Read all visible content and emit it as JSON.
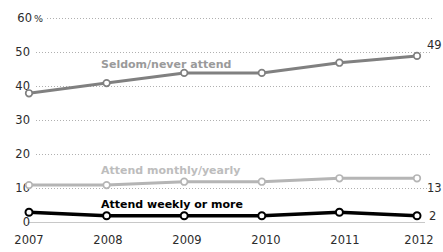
{
  "chart_data": {
    "type": "line",
    "title": "",
    "subtitle": "",
    "xlabel": "",
    "ylabel": "",
    "categories": [
      "2007",
      "2008",
      "2009",
      "2010",
      "2011",
      "2012"
    ],
    "x": [
      2007,
      2008,
      2009,
      2010,
      2011,
      2012
    ],
    "ylim": [
      0,
      60
    ],
    "yticks": [
      0,
      10,
      20,
      30,
      40,
      50,
      60
    ],
    "ytick_labels": [
      "0",
      "10",
      "20",
      "30",
      "40",
      "50",
      "60"
    ],
    "y_unit_suffix": "%",
    "y_unit_on_tick": "60",
    "grid": true,
    "grid_style": "dotted-horizontal",
    "legend": "inline-series-labels",
    "series": [
      {
        "name": "Seldom/never attend",
        "color": "#808080",
        "label_color": "#9a9a9a",
        "values": [
          38,
          41,
          44,
          44,
          47,
          49
        ],
        "end_label": "49"
      },
      {
        "name": "Attend monthly/yearly",
        "color": "#b5b5b5",
        "label_color": "#bdbdbd",
        "values": [
          11,
          11,
          12,
          12,
          13,
          13
        ],
        "end_label": "13"
      },
      {
        "name": "Attend weekly or more",
        "color": "#000000",
        "label_color": "#000000",
        "values": [
          3,
          2,
          2,
          2,
          3,
          2
        ],
        "end_label": "2"
      }
    ]
  },
  "axes": {
    "y_top_label_number": "60",
    "y_top_label_unit": "%",
    "tick_10": "10",
    "tick_20": "20",
    "tick_30": "30",
    "tick_40": "40",
    "tick_50": "50",
    "tick_0": "0"
  },
  "colors": {
    "background": "#ffffff",
    "text": "#2b2b2b",
    "gridline": "#b0b0b0",
    "baseline": "#c8c8c8",
    "marker_fill": "#ffffff"
  }
}
